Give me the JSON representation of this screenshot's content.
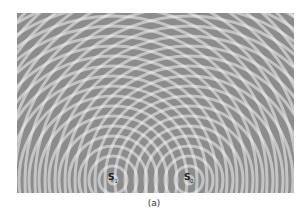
{
  "figure": {
    "background_color": "#8c8c8c",
    "wave_color": "#f2f2f2",
    "wavelength_px": 10,
    "sources": [
      {
        "id": "S1",
        "label": "S",
        "subscript": "1",
        "x": 96,
        "y": 167
      },
      {
        "id": "S2",
        "label": "S",
        "subscript": "2",
        "x": 172,
        "y": 167
      }
    ]
  },
  "caption": "(a)"
}
